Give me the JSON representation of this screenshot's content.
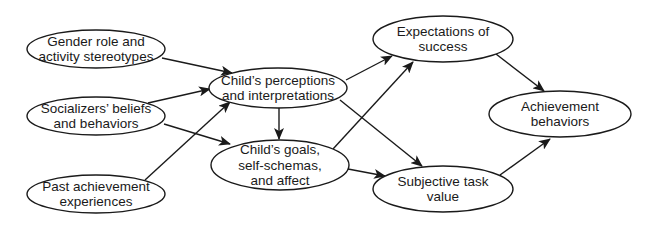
{
  "nodes": [
    {
      "id": "gender",
      "lines": [
        "Gender role and",
        "activity stereotypes"
      ],
      "cx": 96,
      "cy": 49,
      "rx": 69,
      "ry": 19
    },
    {
      "id": "socializers",
      "lines": [
        "Socializers’ beliefs",
        "and behaviors"
      ],
      "cx": 96,
      "cy": 116,
      "rx": 69,
      "ry": 19
    },
    {
      "id": "past",
      "lines": [
        "Past achievement",
        "experiences"
      ],
      "cx": 96,
      "cy": 194,
      "rx": 69,
      "ry": 19
    },
    {
      "id": "perceptions",
      "lines": [
        "Child’s perceptions",
        "and interpretations"
      ],
      "cx": 278,
      "cy": 88,
      "rx": 69,
      "ry": 20
    },
    {
      "id": "goals",
      "lines": [
        "Child’s goals,",
        "self-schemas,",
        "and affect"
      ],
      "cx": 280,
      "cy": 165,
      "rx": 69,
      "ry": 25
    },
    {
      "id": "expectations",
      "lines": [
        "Expectations of",
        "success"
      ],
      "cx": 443,
      "cy": 39,
      "rx": 70,
      "ry": 23
    },
    {
      "id": "value",
      "lines": [
        "Subjective task",
        "value"
      ],
      "cx": 443,
      "cy": 189,
      "rx": 70,
      "ry": 23
    },
    {
      "id": "behaviors",
      "lines": [
        "Achievement",
        "behaviors"
      ],
      "cx": 560,
      "cy": 114,
      "rx": 71,
      "ry": 23
    }
  ],
  "edges": [
    {
      "from": "gender",
      "to": "perceptions",
      "x1": 162,
      "y1": 58,
      "x2": 232,
      "y2": 73
    },
    {
      "from": "socializers",
      "to": "perceptions",
      "x1": 148,
      "y1": 103,
      "x2": 210,
      "y2": 89
    },
    {
      "from": "socializers",
      "to": "goals",
      "x1": 164,
      "y1": 124,
      "x2": 230,
      "y2": 144
    },
    {
      "from": "past",
      "to": "perceptions",
      "x1": 145,
      "y1": 180,
      "x2": 230,
      "y2": 102
    },
    {
      "from": "perceptions",
      "to": "goals",
      "x1": 279,
      "y1": 108,
      "x2": 279,
      "y2": 139
    },
    {
      "from": "perceptions",
      "to": "expectations",
      "x1": 346,
      "y1": 80,
      "x2": 392,
      "y2": 56
    },
    {
      "from": "perceptions",
      "to": "value",
      "x1": 340,
      "y1": 100,
      "x2": 422,
      "y2": 166
    },
    {
      "from": "goals",
      "to": "expectations",
      "x1": 333,
      "y1": 149,
      "x2": 413,
      "y2": 62
    },
    {
      "from": "goals",
      "to": "value",
      "x1": 348,
      "y1": 169,
      "x2": 385,
      "y2": 176
    },
    {
      "from": "expectations",
      "to": "behaviors",
      "x1": 496,
      "y1": 54,
      "x2": 544,
      "y2": 91
    },
    {
      "from": "value",
      "to": "behaviors",
      "x1": 500,
      "y1": 175,
      "x2": 550,
      "y2": 139
    }
  ],
  "colors": {
    "stroke": "#1a1a1a",
    "text": "#1a1a1a",
    "background": "#ffffff"
  }
}
